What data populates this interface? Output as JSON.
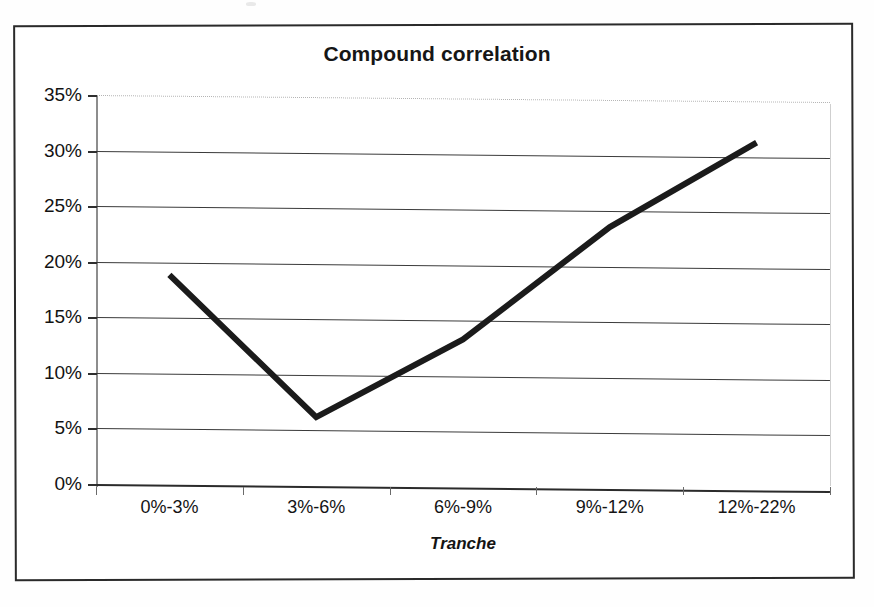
{
  "figure": {
    "title": "Compound correlation",
    "x_axis_title": "Tranche",
    "border_color": "#2a2a2a",
    "line_color": "#1b1b1b",
    "grid_color": "#3b3b3b"
  },
  "chart_data": {
    "type": "line",
    "title": "Compound correlation",
    "xlabel": "Tranche",
    "ylabel": "",
    "categories": [
      "0%-3%",
      "3%-6%",
      "6%-9%",
      "9%-12%",
      "12%-22%"
    ],
    "values": [
      18.9,
      6.1,
      13.1,
      23.2,
      30.8
    ],
    "value_suffix": "%",
    "series": [
      {
        "name": "Compound correlation",
        "values": [
          18.9,
          6.1,
          13.1,
          23.2,
          30.8
        ]
      }
    ],
    "ylim": [
      0,
      35
    ],
    "ytick_values": [
      0,
      5,
      10,
      15,
      20,
      25,
      30,
      35
    ],
    "ytick_labels": [
      "0%",
      "5%",
      "10%",
      "15%",
      "20%",
      "25%",
      "30%",
      "35%"
    ],
    "grid": true,
    "grid_axis": "y",
    "legend": false,
    "markers": false,
    "line_width_px": 6
  },
  "axis": {
    "y_labels": [
      "35%",
      "30%",
      "25%",
      "20%",
      "15%",
      "10%",
      "5%",
      "0%"
    ],
    "x_labels": [
      "0%-3%",
      "3%-6%",
      "6%-9%",
      "9%-12%",
      "12%-22%"
    ]
  }
}
